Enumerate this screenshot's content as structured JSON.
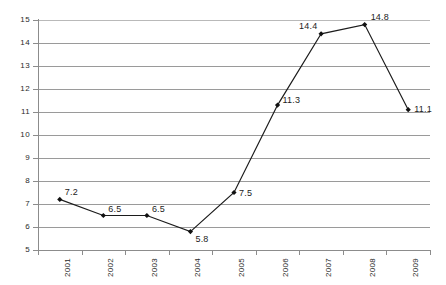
{
  "chart_data": {
    "type": "line",
    "title": "",
    "subtitle": "",
    "xlabel": "",
    "ylabel": "",
    "categories": [
      "2001",
      "2002",
      "2003",
      "2004",
      "2005",
      "2006",
      "2007",
      "2008",
      "2009"
    ],
    "values": [
      7.2,
      6.5,
      6.5,
      5.8,
      7.5,
      11.3,
      14.4,
      14.8,
      11.1
    ],
    "point_labels": [
      "7.2",
      "6.5",
      "6.5",
      "5.8",
      "7.5",
      "11.3",
      "14.4",
      "14.8",
      "11.1"
    ],
    "ylim": [
      5,
      15
    ],
    "ytick_labels": [
      "15",
      "14",
      "13",
      "12",
      "11",
      "10",
      "9",
      "8",
      "7",
      "6",
      "5"
    ],
    "ytick_values": [
      15,
      14,
      13,
      12,
      11,
      10,
      9,
      8,
      7,
      6,
      5
    ],
    "grid": true,
    "legend": false,
    "legend_position": "none",
    "marker": "diamond",
    "colors": {
      "line": "#1c1c1c",
      "marker": "#111111",
      "gridline": "#9a9a9a",
      "axis": "#8c8c8c",
      "text": "#2a2a2a",
      "background": "#ffffff"
    }
  }
}
